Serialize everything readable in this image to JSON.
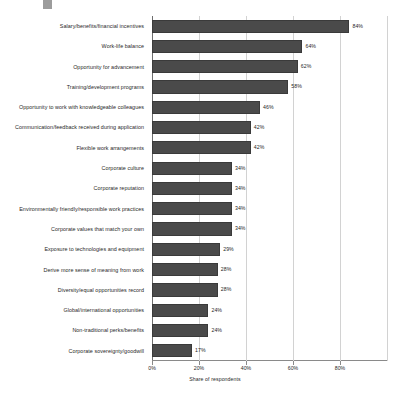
{
  "chart_data": {
    "type": "bar",
    "orientation": "horizontal",
    "title": "",
    "xlabel": "Share of respondents",
    "ylabel": "",
    "xlim": [
      0,
      100
    ],
    "xticks": [
      "0%",
      "20%",
      "40%",
      "60%",
      "80%"
    ],
    "xtick_values": [
      0,
      20,
      40,
      60,
      80
    ],
    "grid": "vertical",
    "legend": "none",
    "bar_color": "#4a4a4a",
    "categories": [
      "Salary/benefits/financial incentives",
      "Work-life balance",
      "Opportunity for advancement",
      "Training/development programs",
      "Opportunity to work with knowledgeable colleagues",
      "Communication/feedback received during application",
      "Flexible work arrangements",
      "Corporate culture",
      "Corporate reputation",
      "Environmentally friendly/responsible work practices",
      "Corporate values that match your own",
      "Exposure to technologies and equipment",
      "Derive more sense of meaning from work",
      "Diversity/equal opportunities record",
      "Global/international opportunities",
      "Non-traditional perks/benefits",
      "Corporate sovereignty/goodwill"
    ],
    "values": [
      84,
      64,
      62,
      58,
      46,
      42,
      42,
      34,
      34,
      34,
      34,
      29,
      28,
      28,
      24,
      24,
      17
    ],
    "value_labels": [
      "84%",
      "64%",
      "62%",
      "58%",
      "46%",
      "42%",
      "42%",
      "34%",
      "34%",
      "34%",
      "34%",
      "29%",
      "28%",
      "28%",
      "24%",
      "24%",
      "17%"
    ]
  }
}
